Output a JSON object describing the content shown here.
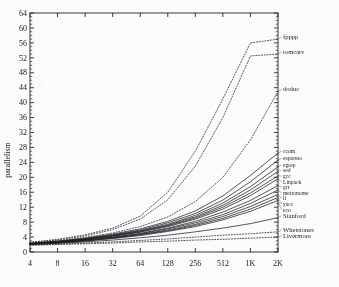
{
  "figure": {
    "ylabel": "parallelism",
    "xlabel": ""
  },
  "chart_data": {
    "type": "line",
    "title": "",
    "xlabel": "",
    "ylabel": "parallelism",
    "x_scale": "log2",
    "x_tick_labels": [
      "4",
      "8",
      "16",
      "32",
      "64",
      "128",
      "256",
      "512",
      "1K",
      "2K"
    ],
    "x_tick_values": [
      4,
      8,
      16,
      32,
      64,
      128,
      256,
      512,
      1024,
      2048
    ],
    "xlim": [
      4,
      2048
    ],
    "y_tick_labels": [
      "0",
      "4",
      "8",
      "12",
      "16",
      "20",
      "24",
      "28",
      "32",
      "36",
      "40",
      "44",
      "48",
      "52",
      "56",
      "60",
      "64"
    ],
    "y_tick_values": [
      0,
      4,
      8,
      12,
      16,
      20,
      24,
      28,
      32,
      36,
      40,
      44,
      48,
      52,
      56,
      60,
      64
    ],
    "ylim": [
      0,
      64
    ],
    "grid": false,
    "minor_ticks": true,
    "legend_position": "right-outside",
    "series": [
      {
        "name": "fpppp",
        "style": "dotted",
        "label_y": 57.0,
        "values": [
          2.6,
          3.4,
          4.6,
          6.4,
          9.6,
          16.0,
          27.0,
          41.0,
          56.0,
          57.0
        ]
      },
      {
        "name": "tomcatv",
        "style": "dotted",
        "label_y": 53.0,
        "values": [
          2.5,
          3.2,
          4.3,
          6.0,
          8.8,
          14.0,
          23.0,
          36.0,
          52.5,
          53.0
        ]
      },
      {
        "name": "doduc",
        "style": "dotted",
        "label_y": 43.0,
        "values": [
          2.4,
          3.0,
          3.9,
          5.1,
          6.8,
          9.4,
          13.5,
          20.0,
          30.0,
          43.0
        ]
      },
      {
        "name": "ccom",
        "style": "solid",
        "label_y": 26.5,
        "values": [
          2.3,
          2.9,
          3.7,
          4.8,
          6.2,
          8.2,
          11.0,
          15.0,
          20.5,
          26.5
        ]
      },
      {
        "name": "espresso",
        "style": "solid",
        "label_y": 24.6,
        "values": [
          2.3,
          2.8,
          3.6,
          4.6,
          5.9,
          7.8,
          10.3,
          13.9,
          18.8,
          24.6
        ]
      },
      {
        "name": "egrep",
        "style": "solid",
        "label_y": 22.8,
        "values": [
          2.2,
          2.8,
          3.5,
          4.5,
          5.7,
          7.4,
          9.8,
          13.1,
          17.5,
          22.8
        ]
      },
      {
        "name": "sed",
        "style": "solid",
        "label_y": 21.6,
        "values": [
          2.2,
          2.7,
          3.4,
          4.4,
          5.6,
          7.2,
          9.4,
          12.5,
          16.6,
          21.6
        ]
      },
      {
        "name": "gcc",
        "style": "solid",
        "label_y": 20.4,
        "values": [
          2.2,
          2.7,
          3.4,
          4.3,
          5.4,
          7.0,
          9.1,
          12.0,
          15.8,
          20.4
        ]
      },
      {
        "name": "Linpack",
        "style": "solid",
        "label_y": 19.6,
        "values": [
          2.2,
          2.7,
          3.3,
          4.2,
          5.3,
          6.8,
          8.8,
          11.5,
          15.1,
          19.6
        ]
      },
      {
        "name": "grr",
        "style": "solid",
        "label_y": 17.8,
        "values": [
          2.1,
          2.6,
          3.2,
          4.0,
          5.0,
          6.4,
          8.2,
          10.7,
          13.8,
          17.8
        ]
      },
      {
        "name": "metronome",
        "style": "solid",
        "label_y": 16.6,
        "values": [
          2.1,
          2.6,
          3.2,
          3.9,
          4.9,
          6.2,
          7.8,
          10.0,
          13.0,
          16.6
        ]
      },
      {
        "name": "li",
        "style": "solid",
        "label_y": 15.4,
        "values": [
          2.1,
          2.5,
          3.1,
          3.8,
          4.7,
          5.9,
          7.4,
          9.5,
          12.2,
          15.4
        ]
      },
      {
        "name": "yacc",
        "style": "solid",
        "label_y": 14.6,
        "values": [
          2.1,
          2.5,
          3.0,
          3.7,
          4.6,
          5.7,
          7.1,
          9.0,
          11.5,
          14.6
        ]
      },
      {
        "name": "eco",
        "style": "solid",
        "label_y": 13.8,
        "values": [
          2.0,
          2.4,
          2.9,
          3.6,
          4.4,
          5.5,
          6.8,
          8.6,
          10.9,
          13.8
        ]
      },
      {
        "name": "Stanford",
        "style": "solid",
        "label_y": 9.2,
        "values": [
          2.0,
          2.3,
          2.7,
          3.2,
          3.8,
          4.5,
          5.4,
          6.4,
          7.6,
          9.2
        ]
      },
      {
        "name": "Whetstones",
        "style": "dotted",
        "label_y": 5.4,
        "values": [
          1.9,
          2.1,
          2.4,
          2.7,
          3.1,
          3.5,
          4.0,
          4.5,
          4.9,
          5.4
        ]
      },
      {
        "name": "Livermore",
        "style": "dotted",
        "label_y": 4.0,
        "values": [
          1.8,
          2.0,
          2.2,
          2.4,
          2.7,
          2.9,
          3.2,
          3.4,
          3.7,
          4.0
        ]
      }
    ],
    "legend_labels": [
      "fpppp",
      "tomcatv",
      "doduc",
      "ccom",
      "espresso",
      "egrep",
      "sed",
      "gcc",
      "Linpack",
      "grr",
      "metronome",
      "li",
      "yacc",
      "eco",
      "Stanford",
      "Whetstones",
      "Livermore"
    ]
  },
  "colors": {
    "ink": "#15151c",
    "frame": "#23232b",
    "paper": "#ffffff"
  }
}
